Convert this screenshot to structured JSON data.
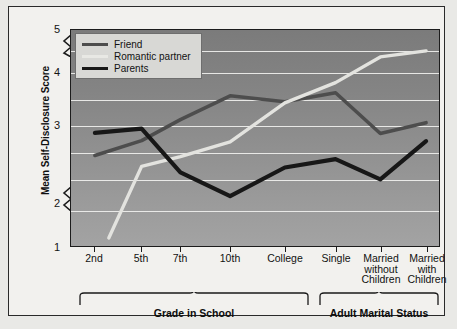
{
  "chart_data": {
    "type": "line",
    "title": "",
    "xlabel": "",
    "ylabel": "Mean Self-Disclosure Score",
    "ylim": [
      1,
      5
    ],
    "yticks": [
      1,
      2,
      3,
      4,
      5
    ],
    "y_axis_break": true,
    "grid": true,
    "legend_position": "top-left",
    "categories": [
      "2nd",
      "5th",
      "7th",
      "10th",
      "College",
      "Single",
      "Married\nwithout\nChildren",
      "Married\nwith\nChildren"
    ],
    "series": [
      {
        "name": "Friend",
        "color": "#4d4d4d",
        "values": [
          2.9,
          3.15,
          3.5,
          3.9,
          3.8,
          3.95,
          3.27,
          3.45
        ]
      },
      {
        "name": "Romantic partner",
        "color": "#e3e3df",
        "values": [
          null,
          2.72,
          2.88,
          3.13,
          3.78,
          4.12,
          4.55,
          4.65
        ]
      },
      {
        "name": "Parents",
        "color": "#171717",
        "values": [
          3.28,
          3.35,
          2.62,
          2.22,
          2.7,
          2.84,
          2.5,
          3.14
        ]
      }
    ],
    "groups": [
      {
        "label": "Grade in School",
        "categories": [
          "2nd",
          "5th",
          "7th",
          "10th",
          "College"
        ]
      },
      {
        "label": "Adult Marital Status",
        "categories": [
          "Single",
          "Married without Children",
          "Married with Children"
        ]
      }
    ]
  },
  "axis": {
    "y_tick_labels": [
      "5",
      "4",
      "3",
      "2",
      "1"
    ],
    "y_title": "Mean Self-Disclosure Score"
  },
  "legend": {
    "items": [
      {
        "label": "Friend",
        "color": "#4d4d4d"
      },
      {
        "label": "Romantic partner",
        "color": "#e8e8e4"
      },
      {
        "label": "Parents",
        "color": "#171717"
      }
    ]
  },
  "x_tick_labels": [
    "2nd",
    "5th",
    "7th",
    "10th",
    "College",
    "Single",
    "Married\nwithout\nChildren",
    "Married\nwith\nChildren"
  ],
  "group_labels": [
    "Grade in School",
    "Adult Marital Status"
  ],
  "colors": {
    "plot_bg_top": "#7b7b7b",
    "plot_bg_bottom": "#a3a3a3",
    "figure_bg": "#f2f1ee",
    "gridline": "#f0f0ee",
    "axis": "#1c1c1c"
  }
}
